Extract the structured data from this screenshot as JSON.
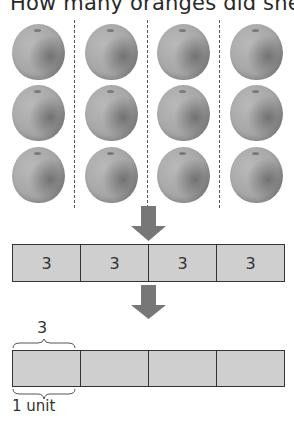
{
  "title": "How many oranges did she give",
  "oranges": {
    "columns": 4,
    "rows": 3,
    "color": "#a6a6a6"
  },
  "top_bar": {
    "cells": [
      "3",
      "3",
      "3",
      "3"
    ],
    "fill": "#cfcfcf"
  },
  "bottom_bar": {
    "cells": [
      "",
      "",
      "",
      ""
    ],
    "fill": "#cfcfcf",
    "top_brace_label": "3",
    "bottom_brace_label": "1 unit"
  },
  "arrow_color": "#777777"
}
